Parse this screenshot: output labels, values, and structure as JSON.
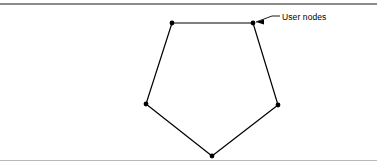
{
  "figure": {
    "background_color": "#ffffff",
    "stroke_color": "#000000",
    "rule_color_top": "#8c8c8c",
    "rule_color_bottom": "#b9b9b9",
    "width": 377,
    "height": 168
  },
  "annotations": {
    "user_nodes_label": "User nodes"
  },
  "chart_data": {
    "type": "diagram",
    "title": "",
    "shape": "pentagon",
    "node_count": 5,
    "node_label": "User nodes",
    "node_radius": 2.4,
    "node_color": "#000000",
    "edge_color": "#000000",
    "edge_width": 1.2,
    "nodes": [
      {
        "id": "n1",
        "x": 172,
        "y": 23
      },
      {
        "id": "n2",
        "x": 253,
        "y": 23
      },
      {
        "id": "n3",
        "x": 278,
        "y": 105
      },
      {
        "id": "n4",
        "x": 212,
        "y": 156
      },
      {
        "id": "n5",
        "x": 146,
        "y": 104
      }
    ],
    "edges": [
      {
        "from": "n1",
        "to": "n2"
      },
      {
        "from": "n2",
        "to": "n3"
      },
      {
        "from": "n3",
        "to": "n4"
      },
      {
        "from": "n4",
        "to": "n5"
      },
      {
        "from": "n5",
        "to": "n1"
      }
    ],
    "leader": {
      "label": "User nodes",
      "arrow_tip_x": 256,
      "arrow_tip_y": 22,
      "bend_x": 272,
      "bend_y": 16,
      "end_x": 280,
      "end_y": 16
    },
    "grid": false,
    "legend": null
  }
}
